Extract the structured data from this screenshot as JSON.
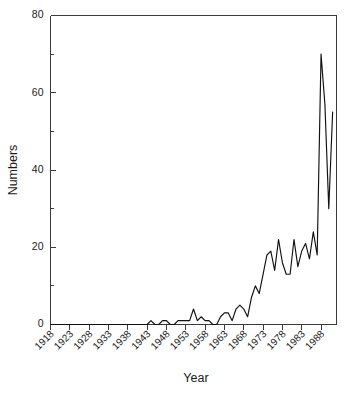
{
  "chart_data": {
    "type": "line",
    "title": "",
    "xlabel": "Year",
    "ylabel": "Numbers",
    "xlim": [
      1918,
      1992
    ],
    "ylim": [
      0,
      80
    ],
    "grid": false,
    "legend": null,
    "y_ticks_major": [
      0,
      20,
      40,
      60,
      80
    ],
    "y_ticks_minor": [
      10,
      30,
      50,
      70
    ],
    "x_ticks_major": [
      1918,
      1923,
      1928,
      1933,
      1938,
      1943,
      1948,
      1953,
      1958,
      1963,
      1968,
      1973,
      1978,
      1983,
      1988
    ],
    "x_tick_labels": [
      "1918",
      "1923",
      "1928",
      "1933",
      "1938",
      "1943",
      "1948",
      "1953",
      "1958",
      "1963",
      "1968",
      "1973",
      "1978",
      "1983",
      "1988"
    ],
    "y_tick_labels": [
      "0",
      "20",
      "40",
      "60",
      "80"
    ],
    "series": [
      {
        "name": "Numbers",
        "color": "#111111",
        "x": [
          1918,
          1919,
          1920,
          1921,
          1922,
          1923,
          1924,
          1925,
          1926,
          1927,
          1928,
          1929,
          1930,
          1931,
          1932,
          1933,
          1934,
          1935,
          1936,
          1937,
          1938,
          1939,
          1940,
          1941,
          1942,
          1943,
          1944,
          1945,
          1946,
          1947,
          1948,
          1949,
          1950,
          1951,
          1952,
          1953,
          1954,
          1955,
          1956,
          1957,
          1958,
          1959,
          1960,
          1961,
          1962,
          1963,
          1964,
          1965,
          1966,
          1967,
          1968,
          1969,
          1970,
          1971,
          1972,
          1973,
          1974,
          1975,
          1976,
          1977,
          1978,
          1979,
          1980,
          1981,
          1982,
          1983,
          1984,
          1985,
          1986,
          1987,
          1988,
          1989,
          1990,
          1991
        ],
        "values": [
          0,
          0,
          0,
          0,
          0,
          0,
          0,
          0,
          0,
          0,
          0,
          0,
          0,
          0,
          0,
          0,
          0,
          0,
          0,
          0,
          0,
          0,
          0,
          0,
          0,
          0,
          1,
          0,
          0,
          1,
          1,
          0,
          0,
          1,
          1,
          1,
          1,
          4,
          1,
          2,
          1,
          1,
          0,
          0,
          2,
          3,
          3,
          1,
          4,
          5,
          4,
          2,
          7,
          10,
          8,
          13,
          18,
          19,
          14,
          22,
          16,
          13,
          13,
          22,
          15,
          19,
          21,
          17,
          24,
          18,
          70,
          57,
          30,
          55
        ]
      }
    ]
  },
  "axes": {
    "y_axis_title": "Numbers",
    "x_axis_title": "Year"
  }
}
